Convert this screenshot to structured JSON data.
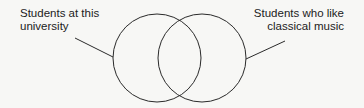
{
  "diagram": {
    "type": "venn",
    "sets": [
      {
        "id": "left",
        "label_lines": [
          "Students at this",
          "university"
        ]
      },
      {
        "id": "right",
        "label_lines": [
          "Students who like",
          "classical music"
        ]
      }
    ],
    "colors": {
      "stroke": "#2a2a2a",
      "background": "#f7f7f5",
      "text": "#222222"
    }
  }
}
